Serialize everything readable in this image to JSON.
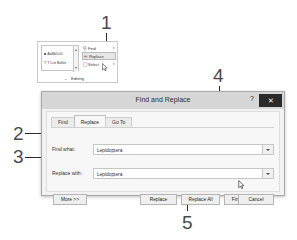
{
  "figure": {
    "callouts": [
      {
        "id": "1",
        "label": "1"
      },
      {
        "id": "2",
        "label": "2"
      },
      {
        "id": "3",
        "label": "3"
      },
      {
        "id": "4",
        "label": "4"
      },
      {
        "id": "5",
        "label": "5"
      }
    ]
  },
  "ribbon": {
    "group_label": "Editing",
    "dialog_launcher": "⌄",
    "styles": {
      "item1": "AaBbCcD",
      "item2": "T List Bullet"
    },
    "commands": [
      {
        "icon": "binoculars-icon",
        "glyph": "A",
        "label": "Find",
        "caret": "▾",
        "selected": false
      },
      {
        "icon": "replace-icon",
        "glyph": "⎘",
        "label": "Replace",
        "caret": "",
        "selected": true
      },
      {
        "icon": "select-icon",
        "glyph": "⬚",
        "label": "Select",
        "caret": "▾",
        "selected": false
      }
    ]
  },
  "dialog": {
    "title": "Find and Replace",
    "help_button": "?",
    "close_button": "✕",
    "tabs": [
      {
        "label": "Find",
        "accel": "F",
        "active": false
      },
      {
        "label": "Replace",
        "accel": "p",
        "active": true
      },
      {
        "label": "Go To",
        "accel": "G",
        "active": false
      }
    ],
    "find": {
      "label": "Find what:",
      "value": "Lepidoptera",
      "dropdown_icon": "chevron-down-icon"
    },
    "replace": {
      "label": "Replace with:",
      "value": "Lepidoptera",
      "dropdown_icon": "chevron-down-icon"
    },
    "buttons": {
      "more": "More >>",
      "replace": "Replace",
      "replace_all": "Replace All",
      "find_next": "Find Next",
      "cancel": "Cancel"
    }
  },
  "colors": {
    "dialog_bg": "#f2f2f2",
    "titlebar": "#d6d6d6",
    "close_btn": "#2a2a2a",
    "leader_line": "#2b2b2b",
    "callout_text": "#4a4a4a"
  }
}
